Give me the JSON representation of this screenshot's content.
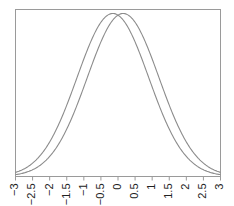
{
  "chart_data": {
    "type": "line",
    "title": "",
    "xlabel": "",
    "ylabel": "",
    "xlim": [
      -3,
      3
    ],
    "ylim": [
      0,
      0.42
    ],
    "grid": false,
    "legend": null,
    "x_ticks": [
      -3,
      -2.5,
      -2,
      -1.5,
      -1,
      -0.5,
      0,
      0.5,
      1,
      1.5,
      2,
      2.5,
      3
    ],
    "x_tick_labels": [
      "−3",
      "−2.5",
      "−2",
      "−1.5",
      "−1",
      "−0.5",
      "0",
      "0.5",
      "1",
      "1.5",
      "2",
      "2.5",
      "3"
    ],
    "series": [
      {
        "name": "curve-left",
        "distribution": "normal",
        "mean": -0.15,
        "sd": 1.05,
        "color": "#8c8c8c"
      },
      {
        "name": "curve-right",
        "distribution": "normal",
        "mean": 0.15,
        "sd": 1.05,
        "color": "#8c8c8c"
      }
    ]
  },
  "style": {
    "axis_color": "#9a9a9a",
    "frame_color": "#9a9a9a"
  }
}
